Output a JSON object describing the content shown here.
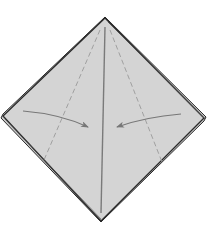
{
  "diagram": {
    "title": "Origami fold step: fold side flaps to center crease",
    "colors": {
      "paper": "#d4d4d4",
      "edge": "#2a2a2a",
      "crease": "#7a7a7a",
      "dashed": "#9a9a9a",
      "arrow": "#777777"
    },
    "shape": {
      "top": [
        105,
        18
      ],
      "left": [
        3,
        116
      ],
      "right": [
        204,
        118
      ],
      "bottom": [
        101,
        221
      ]
    },
    "center_crease": {
      "from": [
        105,
        27
      ],
      "to": [
        101,
        213
      ]
    },
    "valley_folds": [
      {
        "from": [
          100,
          30
        ],
        "to": [
          44,
          160
        ]
      },
      {
        "from": [
          110,
          30
        ],
        "to": [
          162,
          162
        ]
      }
    ],
    "arrows": [
      {
        "name": "left-flap-arrow",
        "from": [
          23,
          111
        ],
        "to": [
          88,
          127
        ]
      },
      {
        "name": "right-flap-arrow",
        "from": [
          181,
          114
        ],
        "to": [
          117,
          127
        ]
      }
    ]
  }
}
